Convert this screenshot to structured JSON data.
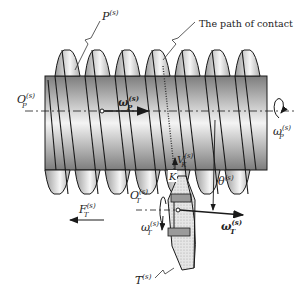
{
  "diagram": {
    "colors": {
      "stroke": "#1a1a1a",
      "thread_light": "#f2f2f2",
      "thread_dark": "#8a8a8a",
      "gear_fill": "#d9d9d9"
    },
    "labels": {
      "worm_surface": {
        "base": "P",
        "sup": "(s)"
      },
      "path_of_contact": "The path of contact",
      "worm_origin": {
        "base": "O",
        "sub": "P",
        "sup": "(s)"
      },
      "worm_omega_vector": {
        "base": "ω",
        "sub": "P",
        "sup": "(s)"
      },
      "worm_omega_rotation": {
        "base": "ω",
        "sub": "P",
        "sup": "(s)"
      },
      "contact_velocity": {
        "base": "V",
        "sub": "K",
        "sup": "(s)"
      },
      "contact_point": "K",
      "angle": {
        "base": "θ",
        "sup": "(s)"
      },
      "gear_origin": {
        "base": "O",
        "sub": "T",
        "sup": "(s)"
      },
      "gear_omega_rotation": {
        "base": "ω",
        "sub": "T",
        "sup": "(s)"
      },
      "gear_omega_vector": {
        "base": "ω",
        "sub": "T",
        "sup": "(s)"
      },
      "force": {
        "base": "F",
        "sub": "T",
        "sup": "(s)"
      },
      "gear_surface": {
        "base": "T",
        "sup": "(s)"
      }
    }
  }
}
